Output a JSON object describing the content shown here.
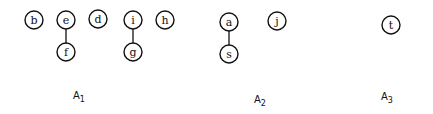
{
  "diagram": {
    "type": "forest",
    "node_radius": 9,
    "nodes": [
      {
        "id": "b",
        "label": "b",
        "x": 34,
        "y": 20
      },
      {
        "id": "e",
        "label": "e",
        "x": 66,
        "y": 20
      },
      {
        "id": "f",
        "label": "f",
        "x": 66,
        "y": 52
      },
      {
        "id": "d",
        "label": "d",
        "x": 98,
        "y": 19
      },
      {
        "id": "i",
        "label": "i",
        "x": 133,
        "y": 20
      },
      {
        "id": "g",
        "label": "g",
        "x": 133,
        "y": 52
      },
      {
        "id": "h",
        "label": "h",
        "x": 165,
        "y": 20
      },
      {
        "id": "a",
        "label": "a",
        "x": 229,
        "y": 22
      },
      {
        "id": "s",
        "label": "s",
        "x": 229,
        "y": 54
      },
      {
        "id": "j",
        "label": "j",
        "x": 277,
        "y": 21
      },
      {
        "id": "t",
        "label": "t",
        "x": 391,
        "y": 25
      }
    ],
    "edges": [
      {
        "from": "e",
        "to": "f"
      },
      {
        "from": "i",
        "to": "g"
      },
      {
        "from": "a",
        "to": "s"
      }
    ],
    "groups": [
      {
        "name": "A",
        "sub": "1",
        "x": 73,
        "y": 90,
        "members": [
          "b",
          "e",
          "f",
          "d",
          "i",
          "g",
          "h"
        ]
      },
      {
        "name": "A",
        "sub": "2",
        "x": 254,
        "y": 94,
        "members": [
          "a",
          "s",
          "j"
        ]
      },
      {
        "name": "A",
        "sub": "3",
        "x": 381,
        "y": 91,
        "members": [
          "t"
        ]
      }
    ]
  }
}
